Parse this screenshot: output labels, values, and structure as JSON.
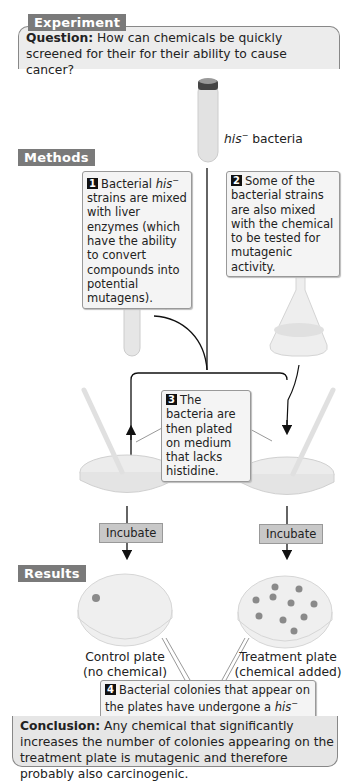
{
  "sections": {
    "experiment": "Experiment",
    "methods": "Methods",
    "results": "Results"
  },
  "question": {
    "label": "Question:",
    "text": " How can chemicals be quickly screened for their for their ability to cause cancer?"
  },
  "top_tube": {
    "label_italic": "his",
    "label_sup": "−",
    "label_rest": " bacteria"
  },
  "steps": [
    {
      "num": "1",
      "parts": [
        "Bacterial ",
        "his",
        "−",
        " strains are mixed with liver enzymes (which have the ability to convert compounds into potential mutagens)."
      ]
    },
    {
      "num": "2",
      "text": "Some of the bacterial strains are also mixed with the chemical to be tested for mutagenic activity."
    },
    {
      "num": "3",
      "text": "The bacteria are then plated on medium that lacks histidine."
    },
    {
      "num": "4",
      "parts": [
        "Bacterial colonies that appear on the plates have undergone a ",
        "his",
        "−",
        " → ",
        "his",
        "+",
        " mutation."
      ]
    }
  ],
  "incubate": {
    "left": "Incubate",
    "right": "Incubate"
  },
  "plates": {
    "control": {
      "line1": "Control plate",
      "line2": "(no chemical)",
      "colonies": 1
    },
    "treatment": {
      "line1": "Treatment plate",
      "line2": "(chemical added)",
      "colonies": 10
    }
  },
  "conclusion": {
    "label": "Conclusion:",
    "text": " Any chemical that significantly increases the number of colonies appearing on the treatment plate is mutagenic and therefore probably also carcinogenic."
  },
  "colors": {
    "tag_bg": "#7a7a7a",
    "box_bg": "#ececec",
    "incubate_bg": "#c8c8c8",
    "colony": "#8a8a8a"
  }
}
